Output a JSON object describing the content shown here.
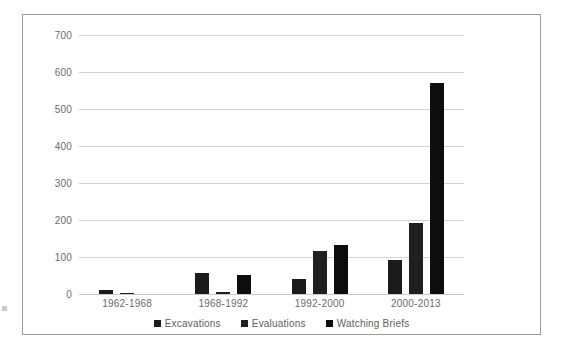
{
  "chart_data": {
    "type": "bar",
    "title": "",
    "xlabel": "",
    "ylabel": "",
    "categories": [
      "1962-1968",
      "1968-1992",
      "1992-2000",
      "2000-2013"
    ],
    "series": [
      {
        "name": "Excavations",
        "values": [
          10,
          57,
          40,
          92
        ],
        "color": "#1b1b1b"
      },
      {
        "name": "Evaluations",
        "values": [
          3,
          6,
          116,
          193
        ],
        "color": "#1f1f1f"
      },
      {
        "name": "Watching Briefs",
        "values": [
          0,
          51,
          132,
          570
        ],
        "color": "#0d0d0d"
      }
    ],
    "yticks": [
      0,
      100,
      200,
      300,
      400,
      500,
      600,
      700
    ],
    "ylim": [
      0,
      700
    ],
    "grid": true,
    "legend_position": "bottom",
    "frame": true
  },
  "colors": {
    "bar": "#161616",
    "gridline": "#d2d2d2",
    "frame_border": "#9a9a9a",
    "tick_text": "#6b6b6b",
    "legend_text": "#5e5e5e",
    "background": "#ffffff"
  }
}
